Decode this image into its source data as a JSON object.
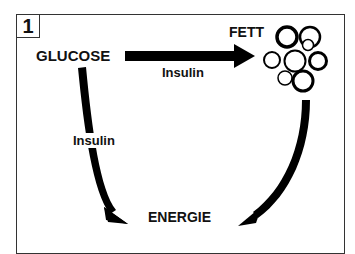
{
  "panel_number": "1",
  "nodes": {
    "glucose": "GLUCOSE",
    "fett": "FETT",
    "energie": "ENERGIE"
  },
  "edges": [
    {
      "from": "GLUCOSE",
      "to": "FETT",
      "label": "Insulin"
    },
    {
      "from": "GLUCOSE",
      "to": "ENERGIE",
      "label": "Insulin"
    },
    {
      "from": "FETT",
      "to": "ENERGIE",
      "label": ""
    }
  ],
  "icons": {
    "fat_cells": "fat-cell-cluster-icon"
  }
}
